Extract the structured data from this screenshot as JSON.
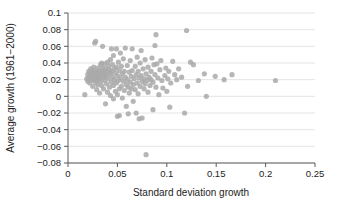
{
  "chart_data": {
    "type": "scatter",
    "title": "",
    "xlabel": "Standard deviation growth",
    "ylabel": "Average growth (1961−2000)",
    "xlim": [
      0,
      0.25
    ],
    "ylim": [
      -0.08,
      0.1
    ],
    "xticks": [
      0,
      0.05,
      0.1,
      0.15,
      0.2,
      0.25
    ],
    "xticklabels": [
      "0",
      "0.05",
      "0.1",
      "0.15",
      "0.2",
      "0.25"
    ],
    "yticks": [
      -0.08,
      -0.06,
      -0.04,
      -0.02,
      0,
      0.02,
      0.04,
      0.06,
      0.08,
      0.1
    ],
    "yticklabels": [
      "−0.08",
      "−0.06",
      "−0.04",
      "−0.02",
      "0",
      "0.02",
      "0.04",
      "0.06",
      "0.08",
      "0.1"
    ],
    "grid": "horizontal",
    "grid_color": "#e2e2e2",
    "legend": "none",
    "marker_color": "#a9a9a9",
    "marker_size": 2.6,
    "axis_color": "#5a5a5a",
    "series": [
      {
        "name": "countries",
        "points": [
          [
            0.017,
            0.002
          ],
          [
            0.019,
            0.021
          ],
          [
            0.02,
            0.026
          ],
          [
            0.02,
            0.018
          ],
          [
            0.021,
            0.03
          ],
          [
            0.021,
            0.022
          ],
          [
            0.022,
            0.027
          ],
          [
            0.022,
            0.016
          ],
          [
            0.023,
            0.024
          ],
          [
            0.023,
            0.033
          ],
          [
            0.024,
            0.02
          ],
          [
            0.024,
            0.028
          ],
          [
            0.025,
            0.023
          ],
          [
            0.025,
            0.031
          ],
          [
            0.025,
            0.012
          ],
          [
            0.026,
            0.026
          ],
          [
            0.026,
            0.019
          ],
          [
            0.026,
            0.035
          ],
          [
            0.027,
            0.022
          ],
          [
            0.027,
            0.029
          ],
          [
            0.027,
            0.064
          ],
          [
            0.028,
            0.025
          ],
          [
            0.028,
            0.017
          ],
          [
            0.028,
            0.066
          ],
          [
            0.029,
            0.03
          ],
          [
            0.029,
            0.021
          ],
          [
            0.029,
            0.008
          ],
          [
            0.03,
            0.024
          ],
          [
            0.03,
            0.034
          ],
          [
            0.03,
            0.014
          ],
          [
            0.031,
            0.027
          ],
          [
            0.031,
            0.02
          ],
          [
            0.032,
            0.031
          ],
          [
            0.032,
            0.023
          ],
          [
            0.032,
            0.004
          ],
          [
            0.033,
            0.038
          ],
          [
            0.033,
            0.026
          ],
          [
            0.033,
            0.018
          ],
          [
            0.034,
            0.04
          ],
          [
            0.034,
            0.029
          ],
          [
            0.034,
            0.013
          ],
          [
            0.035,
            0.034
          ],
          [
            0.035,
            0.022
          ],
          [
            0.035,
            0.06
          ],
          [
            0.036,
            0.031
          ],
          [
            0.036,
            0.025
          ],
          [
            0.036,
            0.009
          ],
          [
            0.037,
            0.039
          ],
          [
            0.037,
            0.028
          ],
          [
            0.037,
            0.019
          ],
          [
            0.038,
            0.033
          ],
          [
            0.038,
            0.023
          ],
          [
            0.038,
            -0.009
          ],
          [
            0.039,
            0.03
          ],
          [
            0.039,
            0.015
          ],
          [
            0.04,
            0.041
          ],
          [
            0.04,
            0.026
          ],
          [
            0.04,
            0.005
          ],
          [
            0.041,
            0.036
          ],
          [
            0.041,
            0.021
          ],
          [
            0.042,
            0.032
          ],
          [
            0.042,
            0.011
          ],
          [
            0.043,
            0.044
          ],
          [
            0.043,
            0.027
          ],
          [
            0.043,
            0.001
          ],
          [
            0.044,
            0.057
          ],
          [
            0.044,
            0.03
          ],
          [
            0.044,
            0.017
          ],
          [
            0.045,
            0.038
          ],
          [
            0.045,
            0.023
          ],
          [
            0.046,
            0.049
          ],
          [
            0.046,
            0.013
          ],
          [
            0.046,
            -0.003
          ],
          [
            0.047,
            0.033
          ],
          [
            0.047,
            0.02
          ],
          [
            0.048,
            0.028
          ],
          [
            0.048,
            0.006
          ],
          [
            0.049,
            0.057
          ],
          [
            0.049,
            0.035
          ],
          [
            0.049,
            0.016
          ],
          [
            0.05,
            0.025
          ],
          [
            0.05,
            0.002
          ],
          [
            0.05,
            -0.024
          ],
          [
            0.051,
            0.041
          ],
          [
            0.051,
            0.019
          ],
          [
            0.052,
            0.031
          ],
          [
            0.052,
            0.009
          ],
          [
            0.052,
            -0.023
          ],
          [
            0.053,
            0.052
          ],
          [
            0.053,
            0.022
          ],
          [
            0.054,
            0.036
          ],
          [
            0.054,
            0.012
          ],
          [
            0.055,
            0.027
          ],
          [
            0.055,
            -0.002
          ],
          [
            0.056,
            0.045
          ],
          [
            0.056,
            0.018
          ],
          [
            0.057,
            0.03
          ],
          [
            0.057,
            0.007
          ],
          [
            0.058,
            0.058
          ],
          [
            0.058,
            0.023
          ],
          [
            0.059,
            0.014
          ],
          [
            0.059,
            -0.012
          ],
          [
            0.06,
            0.037
          ],
          [
            0.06,
            0.02
          ],
          [
            0.061,
            0.011
          ],
          [
            0.061,
            -0.021
          ],
          [
            0.062,
            0.029
          ],
          [
            0.062,
            0.004
          ],
          [
            0.063,
            0.043
          ],
          [
            0.063,
            0.017
          ],
          [
            0.064,
            0.024
          ],
          [
            0.064,
            0.009
          ],
          [
            0.065,
            0.057
          ],
          [
            0.065,
            0.031
          ],
          [
            0.066,
            0.014
          ],
          [
            0.066,
            -0.006
          ],
          [
            0.067,
            0.021
          ],
          [
            0.068,
            0.036
          ],
          [
            0.068,
            0.008
          ],
          [
            0.069,
            0.026
          ],
          [
            0.069,
            -0.02
          ],
          [
            0.07,
            0.047
          ],
          [
            0.07,
            0.016
          ],
          [
            0.071,
            0.03
          ],
          [
            0.071,
            0.003
          ],
          [
            0.072,
            0.022
          ],
          [
            0.072,
            -0.027
          ],
          [
            0.073,
            0.04
          ],
          [
            0.073,
            0.012
          ],
          [
            0.074,
            0.055
          ],
          [
            0.074,
            0.025
          ],
          [
            0.075,
            0.018
          ],
          [
            0.075,
            -0.026
          ],
          [
            0.076,
            0.033
          ],
          [
            0.077,
            0.021
          ],
          [
            0.077,
            0.009
          ],
          [
            0.078,
            0.044
          ],
          [
            0.078,
            0.015
          ],
          [
            0.079,
            0.027
          ],
          [
            0.079,
            -0.07
          ],
          [
            0.08,
            0.019
          ],
          [
            0.081,
            0.035
          ],
          [
            0.081,
            0.005
          ],
          [
            0.082,
            0.023
          ],
          [
            0.083,
            0.013
          ],
          [
            0.084,
            0.03
          ],
          [
            0.084,
            0.02
          ],
          [
            0.085,
            0.046
          ],
          [
            0.086,
            0.017
          ],
          [
            0.086,
            -0.016
          ],
          [
            0.087,
            0.038
          ],
          [
            0.088,
            0.026
          ],
          [
            0.088,
            0.061
          ],
          [
            0.089,
            0.074
          ],
          [
            0.089,
            0.011
          ],
          [
            0.09,
            0.039
          ],
          [
            0.091,
            0.022
          ],
          [
            0.092,
            0.002
          ],
          [
            0.093,
            0.032
          ],
          [
            0.094,
            0.043
          ],
          [
            0.095,
            0.019
          ],
          [
            0.096,
            0.01
          ],
          [
            0.098,
            0.025
          ],
          [
            0.099,
            0.034
          ],
          [
            0.1,
            0.006
          ],
          [
            0.101,
            0.021
          ],
          [
            0.102,
            0.03
          ],
          [
            0.103,
            -0.013
          ],
          [
            0.104,
            0.016
          ],
          [
            0.106,
            0.042
          ],
          [
            0.108,
            0.026
          ],
          [
            0.11,
            0.02
          ],
          [
            0.112,
            0.033
          ],
          [
            0.115,
            0.023
          ],
          [
            0.118,
            -0.02
          ],
          [
            0.12,
            0.079
          ],
          [
            0.121,
            0.012
          ],
          [
            0.124,
            0.041
          ],
          [
            0.127,
            0.038
          ],
          [
            0.132,
            0.019
          ],
          [
            0.138,
            0.027
          ],
          [
            0.14,
            0.0
          ],
          [
            0.149,
            0.024
          ],
          [
            0.158,
            0.02
          ],
          [
            0.166,
            0.026
          ],
          [
            0.21,
            0.019
          ]
        ]
      }
    ]
  },
  "plot_geometry": {
    "left": 68,
    "right": 315,
    "top": 13,
    "bottom": 163
  }
}
